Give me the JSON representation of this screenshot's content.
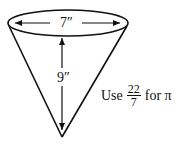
{
  "diagram": {
    "shape": "cone",
    "diameter_label": "7″",
    "height_label": "9″",
    "note": {
      "prefix": "Use",
      "fraction_numerator": "22",
      "fraction_denominator": "7",
      "suffix": "for π"
    }
  }
}
